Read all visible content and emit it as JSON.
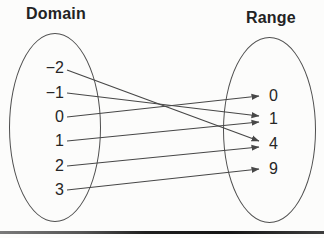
{
  "diagram": {
    "left_label": "Domain",
    "right_label": "Range",
    "domain_values": [
      {
        "label": "−2",
        "x": 64,
        "y": 68
      },
      {
        "label": "−1",
        "x": 64,
        "y": 93
      },
      {
        "label": "0",
        "x": 64,
        "y": 117
      },
      {
        "label": "1",
        "x": 64,
        "y": 141
      },
      {
        "label": "2",
        "x": 64,
        "y": 166
      },
      {
        "label": "3",
        "x": 64,
        "y": 190
      }
    ],
    "range_values": [
      {
        "label": "0",
        "x": 269,
        "y": 96
      },
      {
        "label": "1",
        "x": 269,
        "y": 119
      },
      {
        "label": "4",
        "x": 269,
        "y": 144
      },
      {
        "label": "9",
        "x": 269,
        "y": 169
      }
    ],
    "mappings": [
      {
        "from": "−2",
        "to": "4"
      },
      {
        "from": "−1",
        "to": "1"
      },
      {
        "from": "0",
        "to": "0"
      },
      {
        "from": "1",
        "to": "1"
      },
      {
        "from": "2",
        "to": "4"
      },
      {
        "from": "3",
        "to": "9"
      }
    ],
    "colors": {
      "line": "#474747",
      "text": "#262626",
      "ellipse_stroke": "#4f4f4f"
    }
  }
}
